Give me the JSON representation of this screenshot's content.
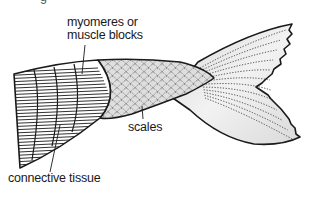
{
  "diagram": {
    "labels": {
      "top_cut": "g",
      "myomeres": [
        "myomeres or",
        "muscle blocks"
      ],
      "scales": "scales",
      "connective_tissue": "connective tissue"
    },
    "parts": [
      "myomeres",
      "scales",
      "caudal-fin",
      "connective-tissue"
    ],
    "colors": {
      "line": "#1a1a1a",
      "fin_fill": "#e6e6e6",
      "scale_fill": "#dcdcdc",
      "background": "#ffffff"
    }
  }
}
